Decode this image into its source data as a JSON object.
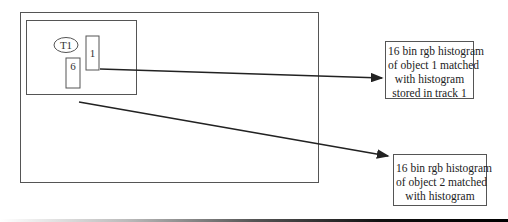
{
  "diagram": {
    "outer_frame": {
      "label": ""
    },
    "scene_box": {
      "track_label": "T1",
      "object_1_label": "1",
      "object_2_label": "6"
    },
    "annotations": [
      {
        "id": "object-1-histogram",
        "lines": [
          "16 bin rgb histogram",
          "of object 1 matched",
          "with histogram",
          "stored in track 1"
        ]
      },
      {
        "id": "object-2-histogram",
        "lines": [
          "16 bin rgb histogram",
          "of object 2 matched",
          "with histogram"
        ]
      }
    ],
    "colors": {
      "stroke": "#555555",
      "arrow": "#222222",
      "text": "#222222"
    }
  }
}
